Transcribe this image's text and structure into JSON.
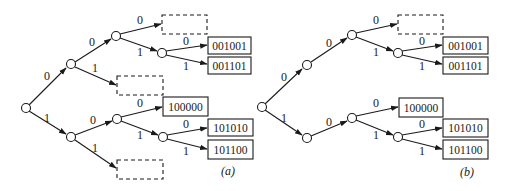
{
  "figure": {
    "panels": [
      {
        "id": "a",
        "caption": "(a)",
        "description": "Binary trie with empty (dashed) leaves",
        "edge_labels": {
          "root_0": "0",
          "root_1": "1",
          "n0_0": "0",
          "n0_1": "1",
          "n00_0": "0",
          "n00_1": "1",
          "n001_0": "0",
          "n001_1": "1",
          "n1_0": "0",
          "n1_1": "1",
          "n10_0": "0",
          "n10_1": "1",
          "n101_0": "0",
          "n101_1": "1"
        },
        "leaves": {
          "n0010": "001001",
          "n0011": "001101",
          "n100": "100000",
          "n1010": "101010",
          "n1011": "101100"
        },
        "empty_leaves": [
          "000",
          "01",
          "11"
        ]
      },
      {
        "id": "b",
        "caption": "(b)",
        "description": "Compressed binary trie with empty leaf pruned where possible",
        "edge_labels": {
          "root_0": "0",
          "root_1": "1",
          "n0_0": "0",
          "n00_0": "0",
          "n00_1": "1",
          "n001_0": "0",
          "n001_1": "1",
          "n1_0": "0",
          "n10_0": "0",
          "n10_1": "1",
          "n101_0": "0",
          "n101_1": "1"
        },
        "leaves": {
          "n0010": "001001",
          "n0011": "001101",
          "n100": "100000",
          "n1010": "101010",
          "n1011": "101100"
        },
        "empty_leaves": [
          "000"
        ]
      }
    ]
  }
}
